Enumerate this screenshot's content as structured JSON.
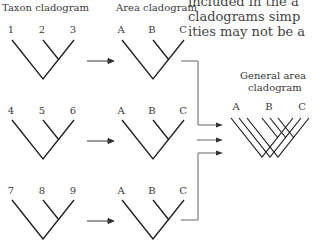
{
  "headers": {
    "taxon": "Taxon cladogram",
    "area": "Area cladogram",
    "general_line1": "General area",
    "general_line2": "cladogram"
  },
  "body_text": [
    "included in the a",
    "cladograms simp",
    "ities may not be a"
  ],
  "rows": [
    {
      "taxa": [
        "1",
        "2",
        "3"
      ],
      "areas": [
        "A",
        "B",
        "C"
      ]
    },
    {
      "taxa": [
        "4",
        "5",
        "6"
      ],
      "areas": [
        "A",
        "B",
        "C"
      ]
    },
    {
      "taxa": [
        "7",
        "8",
        "9"
      ],
      "areas": [
        "A",
        "B",
        "C"
      ]
    }
  ],
  "general": {
    "areas": [
      "A",
      "B",
      "C"
    ]
  },
  "colors": {
    "line": "#222222",
    "connector": "#666666"
  }
}
